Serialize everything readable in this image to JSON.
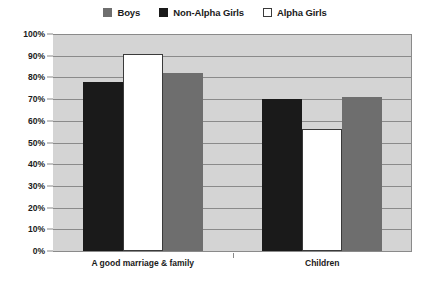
{
  "chart_data": {
    "type": "bar",
    "title": "",
    "xlabel": "",
    "ylabel": "",
    "ylim": [
      0,
      100
    ],
    "grid": true,
    "legend_position": "top-center",
    "categories": [
      "A good marriage & family",
      "Children"
    ],
    "series": [
      {
        "name": "Boys",
        "color": "#6e6e6e",
        "values": [
          82,
          71
        ]
      },
      {
        "name": "Non-Alpha Girls",
        "color": "#1a1a1a",
        "values": [
          78,
          70
        ]
      },
      {
        "name": "Alpha Girls",
        "color": "#ffffff",
        "values": [
          91,
          56
        ]
      }
    ],
    "draw_order": [
      "Non-Alpha Girls",
      "Alpha Girls",
      "Boys"
    ],
    "yticks": [
      "0%",
      "10%",
      "20%",
      "30%",
      "40%",
      "50%",
      "60%",
      "70%",
      "80%",
      "90%",
      "100%"
    ],
    "ytick_values": [
      0,
      10,
      20,
      30,
      40,
      50,
      60,
      70,
      80,
      90,
      100
    ]
  },
  "legend": {
    "items": [
      {
        "label": "Boys",
        "swatch": "legend-swatch-boys"
      },
      {
        "label": "Non-Alpha Girls",
        "swatch": "legend-swatch-non-alpha-girls"
      },
      {
        "label": "Alpha Girls",
        "swatch": "legend-swatch-alpha-girls"
      }
    ]
  },
  "colors": {
    "plot_background": "#d4d4d4",
    "gridline": "#8a8a8a",
    "boys": "#6e6e6e",
    "non_alpha_girls": "#1a1a1a",
    "alpha_girls": "#ffffff",
    "text": "#1a1a1a"
  }
}
